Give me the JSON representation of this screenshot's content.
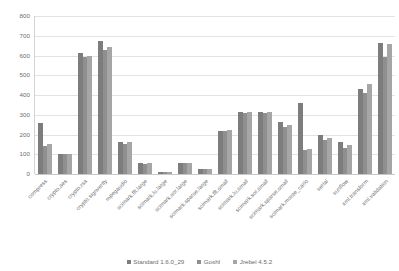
{
  "chart_data": {
    "type": "bar",
    "title": "",
    "subtitle": "",
    "xlabel": "",
    "ylabel": "",
    "ylim": [
      0,
      800
    ],
    "ytick_step": 100,
    "yticks": [
      "800",
      "700",
      "600",
      "500",
      "400",
      "300",
      "200",
      "100",
      "0"
    ],
    "grid": true,
    "legend_position": "bottom",
    "categories": [
      "compress",
      "crypto.aes",
      "crypto.rsa",
      "crypto.signverify",
      "mpegaudio",
      "scimark.fft.large",
      "scimark.lu.large",
      "scimark.sor.large",
      "scimark.sparse.large",
      "scimark.fft.small",
      "scimark.lu.small",
      "scimark.sor.small",
      "scimark.sparse.small",
      "scimark.monte_carlo",
      "serial",
      "sunflow",
      "xml.transform",
      "xml.validation"
    ],
    "series": [
      {
        "name": "Standard 1.6.0_29",
        "color": "#7d7d7d",
        "values": [
          258,
          101,
          612,
          673,
          164,
          55,
          11,
          57,
          26,
          220,
          312,
          312,
          262,
          360,
          196,
          163,
          432,
          664
        ]
      },
      {
        "name": "GoshI",
        "color": "#8f8f8f",
        "values": [
          140,
          100,
          590,
          629,
          151,
          52,
          10,
          55,
          24,
          218,
          310,
          311,
          236,
          121,
          174,
          132,
          408,
          590
        ]
      },
      {
        "name": "Jrebel 4.5.2",
        "color": "#a6a6a6",
        "values": [
          152,
          100,
          600,
          641,
          161,
          55,
          11,
          57,
          26,
          221,
          312,
          312,
          249,
          126,
          183,
          146,
          455,
          657
        ]
      }
    ]
  }
}
